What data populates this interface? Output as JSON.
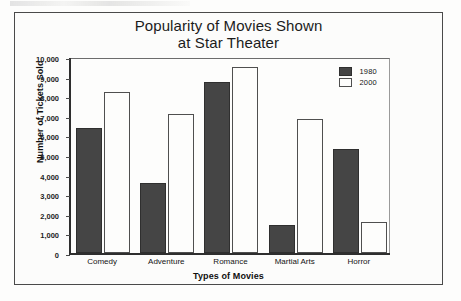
{
  "chart_data": {
    "type": "bar",
    "title": "Popularity of Movies Shown at Star Theater",
    "title_line1": "Popularity of Movies Shown",
    "title_line2": "at Star Theater",
    "xlabel": "Types of Movies",
    "ylabel": "Number of Tickets Sold",
    "categories": [
      "Comedy",
      "Adventure",
      "Romance",
      "Martial Arts",
      "Horror"
    ],
    "series": [
      {
        "name": "1980",
        "color": "#454545",
        "values": [
          6300,
          3450,
          8600,
          1350,
          5200
        ]
      },
      {
        "name": "2000",
        "color": "#ffffff",
        "values": [
          8100,
          7000,
          9400,
          6750,
          1500
        ]
      }
    ],
    "ylim": [
      0,
      10000
    ],
    "ytick_step": 1000,
    "ytick_labels": [
      "10,000",
      "9,000",
      "8,000",
      "7,000",
      "6,000",
      "5,000",
      "4,000",
      "3,000",
      "2,000",
      "1,000",
      "0"
    ],
    "ytick_values": [
      10000,
      9000,
      8000,
      7000,
      6000,
      5000,
      4000,
      3000,
      2000,
      1000,
      0
    ],
    "grid": false,
    "legend_position": "top-right",
    "legend_entries": [
      "1980",
      "2000"
    ]
  }
}
